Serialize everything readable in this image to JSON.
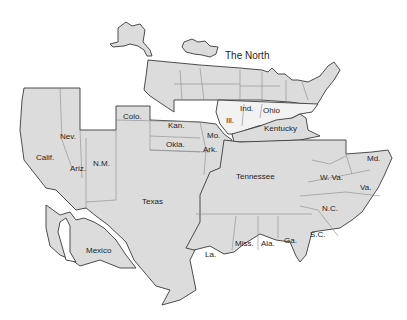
{
  "map": {
    "title": "The North",
    "colors": {
      "land": "#dcdcdc",
      "outline": "#3a3a3a",
      "inner_border": "#8a8a8a",
      "background": "#ffffff"
    },
    "regions": [
      {
        "id": "north",
        "label": "The North"
      },
      {
        "id": "ind",
        "label": "Ind."
      },
      {
        "id": "ohio",
        "label": "Ohio"
      },
      {
        "id": "ill",
        "label": "Ill."
      },
      {
        "id": "kentucky",
        "label": "Kentucky"
      },
      {
        "id": "colo",
        "label": "Colo."
      },
      {
        "id": "kan",
        "label": "Kan."
      },
      {
        "id": "mo",
        "label": "Mo."
      },
      {
        "id": "okla",
        "label": "Okla."
      },
      {
        "id": "ark",
        "label": "Ark."
      },
      {
        "id": "nev",
        "label": "Nev."
      },
      {
        "id": "calif",
        "label": "Calif."
      },
      {
        "id": "ariz",
        "label": "Ariz."
      },
      {
        "id": "nm",
        "label": "N.M."
      },
      {
        "id": "texas",
        "label": "Texas"
      },
      {
        "id": "mexico",
        "label": "Mexico"
      },
      {
        "id": "tennessee",
        "label": "Tennessee"
      },
      {
        "id": "md",
        "label": "Md."
      },
      {
        "id": "wva",
        "label": "W. Va."
      },
      {
        "id": "va",
        "label": "Va."
      },
      {
        "id": "nc",
        "label": "N.C."
      },
      {
        "id": "sc",
        "label": "S.C."
      },
      {
        "id": "ga",
        "label": "Ga."
      },
      {
        "id": "ala",
        "label": "Ala."
      },
      {
        "id": "miss",
        "label": "Miss."
      },
      {
        "id": "la",
        "label": "La."
      }
    ]
  }
}
